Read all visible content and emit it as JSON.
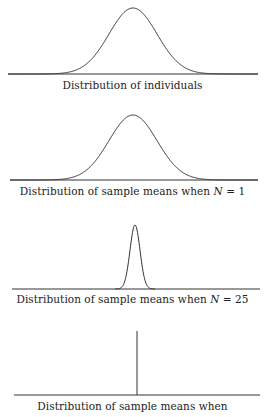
{
  "panels": [
    {
      "caption": "Distribution of individuals",
      "shape": "wide-normal",
      "sigma_px": 24,
      "peak_x": 133,
      "peak_y": 8,
      "baseline_y": 74,
      "axis_x": [
        8,
        258
      ]
    },
    {
      "caption_prefix": "Distribution of sample means when ",
      "caption_var": "N",
      "caption_suffix": " = 1",
      "shape": "wide-normal",
      "sigma_px": 24,
      "peak_x": 133,
      "peak_y": 115,
      "baseline_y": 180,
      "axis_x": [
        10,
        258
      ]
    },
    {
      "caption_prefix": "Distribution of sample means when ",
      "caption_var": "N",
      "caption_suffix": " = 25",
      "shape": "narrow-normal",
      "sigma_px": 5,
      "peak_x": 135,
      "peak_y": 225,
      "baseline_y": 289,
      "axis_x": [
        12,
        260
      ]
    },
    {
      "caption": "Distribution of sample means when",
      "shape": "spike",
      "peak_x": 137,
      "peak_y": 331,
      "baseline_y": 395,
      "axis_x": [
        14,
        260
      ]
    }
  ],
  "colors": {
    "line": "#333333",
    "text": "#222222",
    "background": "#ffffff"
  }
}
